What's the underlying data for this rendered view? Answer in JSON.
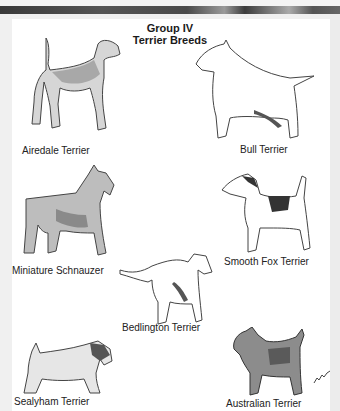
{
  "header": {
    "title": "Group IV",
    "subtitle": "Terrier Breeds"
  },
  "breeds": [
    {
      "name": "Airedale Terrier"
    },
    {
      "name": "Bull Terrier"
    },
    {
      "name": "Miniature Schnauzer"
    },
    {
      "name": "Smooth Fox Terrier"
    },
    {
      "name": "Bedlington Terrier"
    },
    {
      "name": "Sealyham Terrier"
    },
    {
      "name": "Australian Terrier"
    }
  ],
  "colors": {
    "page": "#ffffff",
    "background": "#f0f0f0",
    "text": "#222222",
    "bar": "#3a3a3a"
  }
}
